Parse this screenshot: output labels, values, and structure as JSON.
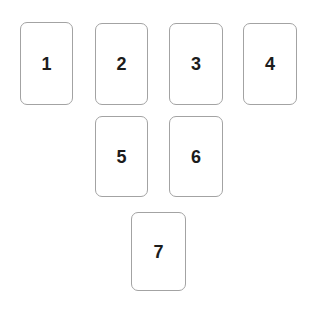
{
  "board": {
    "name": "numbered-card-layout",
    "background_color": "#ffffff",
    "card_style": {
      "fill": "#ffffff",
      "border_color": "#a3a3a3",
      "border_width_px": 1,
      "corner_radius_px": 7,
      "label_color": "#1c1c1c",
      "label_font_size_px": 18,
      "label_font_weight": "bold"
    },
    "rows": [
      {
        "row_index": 1,
        "cards": [
          {
            "label": "1",
            "x": 20,
            "y": 22,
            "width": 53,
            "height": 83
          },
          {
            "label": "2",
            "x": 95,
            "y": 23,
            "width": 53,
            "height": 82
          },
          {
            "label": "3",
            "x": 169,
            "y": 23,
            "width": 54,
            "height": 82
          },
          {
            "label": "4",
            "x": 243,
            "y": 23,
            "width": 54,
            "height": 82
          }
        ]
      },
      {
        "row_index": 2,
        "cards": [
          {
            "label": "5",
            "x": 95,
            "y": 116,
            "width": 53,
            "height": 81
          },
          {
            "label": "6",
            "x": 169,
            "y": 116,
            "width": 54,
            "height": 81
          }
        ]
      },
      {
        "row_index": 3,
        "cards": [
          {
            "label": "7",
            "x": 131,
            "y": 212,
            "width": 55,
            "height": 79
          }
        ]
      }
    ]
  }
}
